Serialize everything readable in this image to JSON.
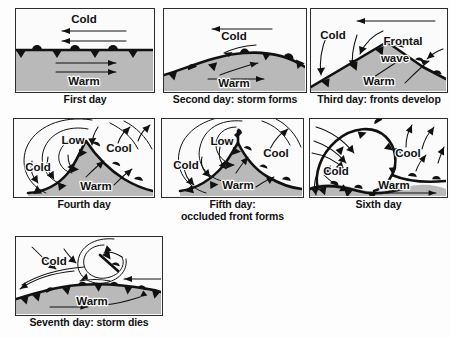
{
  "figure": {
    "background_color": "#fdfdfd",
    "warm_sector_color": "#b9b9b9",
    "line_color": "#111111"
  },
  "panels": [
    {
      "id": "first-day",
      "caption": "First day",
      "labels": [
        "Cold",
        "Warm"
      ],
      "front_type": "stationary",
      "description": "Straight stationary front with cold air flowing west above and warm air flowing east below"
    },
    {
      "id": "second-day",
      "caption": "Second day: storm forms",
      "labels": [
        "Cold",
        "Warm"
      ],
      "front_type": "wave",
      "description": "Front bulges into a low broad wave as the storm begins to form"
    },
    {
      "id": "third-day",
      "caption": "Third day: fronts develop",
      "labels": [
        "Cold",
        "Frontal",
        "wave",
        "Warm"
      ],
      "front_type": "cold-and-warm",
      "description": "A sharp frontal wave with distinct cold front and warm front"
    },
    {
      "id": "fourth-day",
      "caption": "Fourth day",
      "labels": [
        "Low",
        "Cold",
        "Cool",
        "Warm"
      ],
      "front_type": "open-wave",
      "description": "Mature open wave cyclone with a low centre and circulating isobars"
    },
    {
      "id": "fifth-day",
      "caption": "Fifth day:\noccluded front forms",
      "labels": [
        "Low",
        "Cold",
        "Cool",
        "Warm"
      ],
      "front_type": "occluded",
      "description": "Cold front overtakes warm front, occluded front forms at the low centre"
    },
    {
      "id": "sixth-day",
      "caption": "Sixth day",
      "labels": [
        "Cold",
        "Cool",
        "Warm"
      ],
      "front_type": "occluded-large",
      "description": "Large occlusion wraps around the low, warm sector pushed far south and east"
    },
    {
      "id": "seventh-day",
      "caption": "Seventh day: storm dies",
      "labels": [
        "Cold",
        "Warm"
      ],
      "front_type": "dissipating",
      "description": "Storm dissipates leaving a spiralling remnant low and a stationary front"
    }
  ]
}
